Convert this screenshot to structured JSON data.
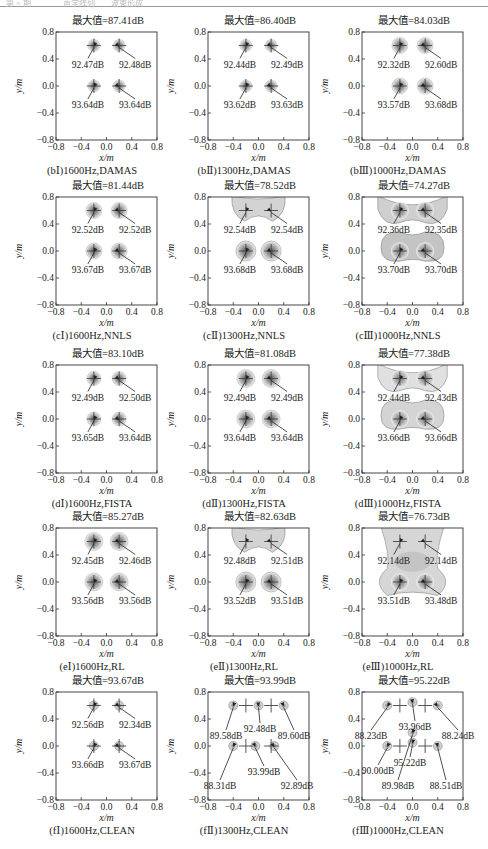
{
  "header": {
    "text": "第 × 期　　　　声学阵列　　波束形成"
  },
  "chart_data": {
    "type": "heatmap",
    "layout": "5 rows x 3 columns of acoustic beamforming source maps",
    "xlabel": "x/m",
    "ylabel": "y/m",
    "xlim": [
      -0.8,
      0.8
    ],
    "ylim": [
      -0.8,
      0.8
    ],
    "xticks": [
      "−0.8",
      "−0.4",
      "0.0",
      "0.4",
      "0.8"
    ],
    "yticks": [
      "0.8",
      "0.4",
      "0.0",
      "−0.4",
      "−0.8"
    ],
    "panels": [
      {
        "id": "bI",
        "title": "最大值=87.41dB",
        "caption": "(bⅠ)1600Hz,DAMAS",
        "freq_hz": 1600,
        "method": "DAMAS",
        "max_db": 87.41,
        "sources": [
          {
            "x": -0.2,
            "y": 0.6,
            "label": "92.47dB"
          },
          {
            "x": 0.2,
            "y": 0.6,
            "label": "92.48dB"
          },
          {
            "x": -0.2,
            "y": 0.0,
            "label": "93.64dB"
          },
          {
            "x": 0.2,
            "y": 0.0,
            "label": "93.64dB"
          }
        ]
      },
      {
        "id": "bII",
        "title": "最大值=86.40dB",
        "caption": "(bⅡ)1300Hz,DAMAS",
        "freq_hz": 1300,
        "method": "DAMAS",
        "max_db": 86.4,
        "sources": [
          {
            "x": -0.2,
            "y": 0.6,
            "label": "92.44dB"
          },
          {
            "x": 0.2,
            "y": 0.6,
            "label": "92.49dB"
          },
          {
            "x": -0.2,
            "y": 0.0,
            "label": "93.62dB"
          },
          {
            "x": 0.2,
            "y": 0.0,
            "label": "93.63dB"
          }
        ]
      },
      {
        "id": "bIII",
        "title": "最大值=84.03dB",
        "caption": "(bⅢ)1000Hz,DAMAS",
        "freq_hz": 1000,
        "method": "DAMAS",
        "max_db": 84.03,
        "sources": [
          {
            "x": -0.2,
            "y": 0.6,
            "label": "92.32dB"
          },
          {
            "x": 0.2,
            "y": 0.6,
            "label": "92.60dB"
          },
          {
            "x": -0.2,
            "y": 0.0,
            "label": "93.57dB"
          },
          {
            "x": 0.2,
            "y": 0.0,
            "label": "93.68dB"
          }
        ]
      },
      {
        "id": "cI",
        "title": "最大值=81.44dB",
        "caption": "(cⅠ)1600Hz,NNLS",
        "freq_hz": 1600,
        "method": "NNLS",
        "max_db": 81.44,
        "sources": [
          {
            "x": -0.2,
            "y": 0.6,
            "label": "92.52dB"
          },
          {
            "x": 0.2,
            "y": 0.6,
            "label": "92.52dB"
          },
          {
            "x": -0.2,
            "y": 0.0,
            "label": "93.67dB"
          },
          {
            "x": 0.2,
            "y": 0.0,
            "label": "93.67dB"
          }
        ]
      },
      {
        "id": "cII",
        "title": "最大值=78.52dB",
        "caption": "(cⅡ)1300Hz,NNLS",
        "freq_hz": 1300,
        "method": "NNLS",
        "max_db": 78.52,
        "sources": [
          {
            "x": -0.2,
            "y": 0.6,
            "label": "92.54dB"
          },
          {
            "x": 0.2,
            "y": 0.6,
            "label": "92.54dB"
          },
          {
            "x": -0.2,
            "y": 0.0,
            "label": "93.68dB"
          },
          {
            "x": 0.2,
            "y": 0.0,
            "label": "93.68dB"
          }
        ]
      },
      {
        "id": "cIII",
        "title": "最大值=74.27dB",
        "caption": "(cⅢ)1000Hz,NNLS",
        "freq_hz": 1000,
        "method": "NNLS",
        "max_db": 74.27,
        "sources": [
          {
            "x": -0.2,
            "y": 0.6,
            "label": "92.36dB"
          },
          {
            "x": 0.2,
            "y": 0.6,
            "label": "92.35dB"
          },
          {
            "x": -0.2,
            "y": 0.0,
            "label": "93.70dB"
          },
          {
            "x": 0.2,
            "y": 0.0,
            "label": "93.70dB"
          }
        ]
      },
      {
        "id": "dI",
        "title": "最大值=83.10dB",
        "caption": "(dⅠ)1600Hz,FISTA",
        "freq_hz": 1600,
        "method": "FISTA",
        "max_db": 83.1,
        "sources": [
          {
            "x": -0.2,
            "y": 0.6,
            "label": "92.49dB"
          },
          {
            "x": 0.2,
            "y": 0.6,
            "label": "92.50dB"
          },
          {
            "x": -0.2,
            "y": 0.0,
            "label": "93.65dB"
          },
          {
            "x": 0.2,
            "y": 0.0,
            "label": "93.64dB"
          }
        ]
      },
      {
        "id": "dII",
        "title": "最大值=81.08dB",
        "caption": "(dⅡ)1300Hz,FISTA",
        "freq_hz": 1300,
        "method": "FISTA",
        "max_db": 81.08,
        "sources": [
          {
            "x": -0.2,
            "y": 0.6,
            "label": "92.49dB"
          },
          {
            "x": 0.2,
            "y": 0.6,
            "label": "92.49dB"
          },
          {
            "x": -0.2,
            "y": 0.0,
            "label": "93.64dB"
          },
          {
            "x": 0.2,
            "y": 0.0,
            "label": "93.64dB"
          }
        ]
      },
      {
        "id": "dIII",
        "title": "最大值=77.38dB",
        "caption": "(dⅢ)1000Hz,FISTA",
        "freq_hz": 1000,
        "method": "FISTA",
        "max_db": 77.38,
        "sources": [
          {
            "x": -0.2,
            "y": 0.6,
            "label": "92.44dB"
          },
          {
            "x": 0.2,
            "y": 0.6,
            "label": "92.43dB"
          },
          {
            "x": -0.2,
            "y": 0.0,
            "label": "93.66dB"
          },
          {
            "x": 0.2,
            "y": 0.0,
            "label": "93.66dB"
          }
        ]
      },
      {
        "id": "eI",
        "title": "最大值=85.27dB",
        "caption": "(eⅠ)1600Hz,RL",
        "freq_hz": 1600,
        "method": "RL",
        "max_db": 85.27,
        "sources": [
          {
            "x": -0.2,
            "y": 0.6,
            "label": "92.45dB"
          },
          {
            "x": 0.2,
            "y": 0.6,
            "label": "92.46dB"
          },
          {
            "x": -0.2,
            "y": 0.0,
            "label": "93.56dB"
          },
          {
            "x": 0.2,
            "y": 0.0,
            "label": "93.56dB"
          }
        ]
      },
      {
        "id": "eII",
        "title": "最大值=82.63dB",
        "caption": "(eⅡ)1300Hz,RL",
        "freq_hz": 1300,
        "method": "RL",
        "max_db": 82.63,
        "sources": [
          {
            "x": -0.2,
            "y": 0.6,
            "label": "92.48dB"
          },
          {
            "x": 0.2,
            "y": 0.6,
            "label": "92.51dB"
          },
          {
            "x": -0.2,
            "y": 0.0,
            "label": "93.52dB"
          },
          {
            "x": 0.2,
            "y": 0.0,
            "label": "93.51dB"
          }
        ]
      },
      {
        "id": "eIII",
        "title": "最大值=76.73dB",
        "caption": "(eⅢ)1000Hz,RL",
        "freq_hz": 1000,
        "method": "RL",
        "max_db": 76.73,
        "sources": [
          {
            "x": -0.2,
            "y": 0.6,
            "label": "92.14dB"
          },
          {
            "x": 0.2,
            "y": 0.6,
            "label": "92.14dB"
          },
          {
            "x": -0.2,
            "y": 0.0,
            "label": "93.51dB"
          },
          {
            "x": 0.2,
            "y": 0.0,
            "label": "93.48dB"
          }
        ]
      },
      {
        "id": "fI",
        "title": "最大值=93.67dB",
        "caption": "(fⅠ)1600Hz,CLEAN",
        "freq_hz": 1600,
        "method": "CLEAN",
        "max_db": 93.67,
        "sources": [
          {
            "x": -0.2,
            "y": 0.6,
            "label": "92.56dB"
          },
          {
            "x": 0.2,
            "y": 0.6,
            "label": "92.34dB"
          },
          {
            "x": -0.2,
            "y": 0.0,
            "label": "93.66dB"
          },
          {
            "x": 0.2,
            "y": 0.0,
            "label": "93.67dB"
          }
        ]
      },
      {
        "id": "fII",
        "title": "最大值=93.99dB",
        "caption": "(fⅡ)1300Hz,CLEAN",
        "freq_hz": 1300,
        "method": "CLEAN",
        "max_db": 93.99,
        "sources": [
          {
            "x": -0.4,
            "y": 0.6,
            "label": "89.58dB"
          },
          {
            "x": 0.0,
            "y": 0.6,
            "label": "92.48dB"
          },
          {
            "x": 0.4,
            "y": 0.6,
            "label": "89.60dB"
          },
          {
            "x": -0.4,
            "y": 0.0,
            "label": "88.31dB"
          },
          {
            "x": -0.05,
            "y": 0.0,
            "label": "93.99dB"
          },
          {
            "x": 0.25,
            "y": 0.0,
            "label": "92.89dB"
          }
        ]
      },
      {
        "id": "fIII",
        "title": "最大值=95.22dB",
        "caption": "(fⅢ)1000Hz,CLEAN",
        "freq_hz": 1000,
        "method": "CLEAN",
        "max_db": 95.22,
        "sources": [
          {
            "x": -0.4,
            "y": 0.6,
            "label": "88.23dB"
          },
          {
            "x": 0.0,
            "y": 0.65,
            "label": "93.96dB"
          },
          {
            "x": 0.4,
            "y": 0.6,
            "label": "88.24dB"
          },
          {
            "x": -0.4,
            "y": 0.0,
            "label": "90.00dB"
          },
          {
            "x": 0.0,
            "y": 0.05,
            "label": "95.22dB"
          },
          {
            "x": 0.0,
            "y": 0.2,
            "label": "89.98dB"
          },
          {
            "x": 0.4,
            "y": 0.0,
            "label": "88.51dB"
          }
        ]
      }
    ],
    "grid": false,
    "legend": "none",
    "colormap": "grayscale"
  }
}
